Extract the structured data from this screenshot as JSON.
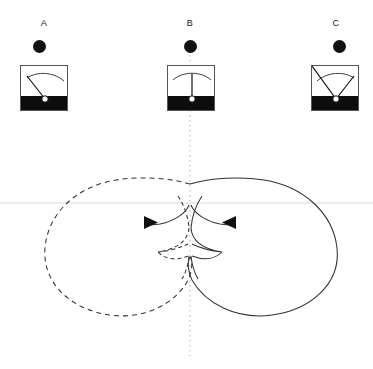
{
  "diagram": {
    "width": 373,
    "height": 369,
    "background": "#ffffff",
    "stroke_color": "#333333",
    "axis_color": "#cccccc",
    "marker_color": "#111111"
  },
  "meters": [
    {
      "id": "meter-a",
      "label": "A",
      "label_x": 44,
      "label_y": 18,
      "dot_x": 33,
      "dot_y": 40,
      "box_x": 20,
      "box_y": 65,
      "needle_angle_deg": -48,
      "needle_direction": "up-left",
      "reading": "left-deflection"
    },
    {
      "id": "meter-b",
      "label": "B",
      "label_x": 190,
      "label_y": 18,
      "dot_x": 184,
      "dot_y": 40,
      "box_x": 167,
      "box_y": 65,
      "needle_angle_deg": 0,
      "needle_direction": "vertical",
      "reading": "center-deflection"
    },
    {
      "id": "meter-c",
      "label": "C",
      "label_x": 336,
      "label_y": 18,
      "dot_x": 333,
      "dot_y": 40,
      "box_x": 311,
      "box_y": 65,
      "needle_angle_deg": 44,
      "needle_direction": "up-right",
      "reading": "right-deflection"
    }
  ],
  "axes": {
    "horizontal_line": {
      "y": 203,
      "x1": 0,
      "x2": 373,
      "color": "#d8d8d8",
      "style": "solid"
    },
    "vertical_line": {
      "x": 190,
      "y1": 55,
      "y2": 356,
      "color": "#b9b9b9",
      "style": "dotted"
    }
  },
  "lobes": [
    {
      "id": "left-lobe",
      "style": "dashed",
      "color": "#333333",
      "bounds": {
        "x_min": 44,
        "x_max": 190,
        "y_min": 179,
        "y_max": 316
      },
      "description": "large dashed cardioid lobe pointing left"
    },
    {
      "id": "right-lobe",
      "style": "solid",
      "color": "#333333",
      "bounds": {
        "x_min": 190,
        "x_max": 339,
        "y_min": 179,
        "y_max": 316
      },
      "description": "large solid cardioid lobe pointing right"
    },
    {
      "id": "inner-upper-left-arc",
      "style": "solid",
      "color": "#333333",
      "description": "small upper arc sweeping left with arrowhead"
    },
    {
      "id": "inner-upper-right-arc",
      "style": "solid",
      "color": "#333333",
      "description": "small upper arc sweeping right with arrowhead"
    },
    {
      "id": "inner-diamond",
      "style": "mixed",
      "color": "#333333",
      "description": "small astroid/diamond of minor lobes at the centre node"
    }
  ],
  "arrowheads": [
    {
      "id": "arrow-left",
      "x": 152,
      "y": 222,
      "points": "right",
      "color": "#111111"
    },
    {
      "id": "arrow-right",
      "x": 228,
      "y": 222,
      "points": "left",
      "color": "#111111"
    }
  ]
}
